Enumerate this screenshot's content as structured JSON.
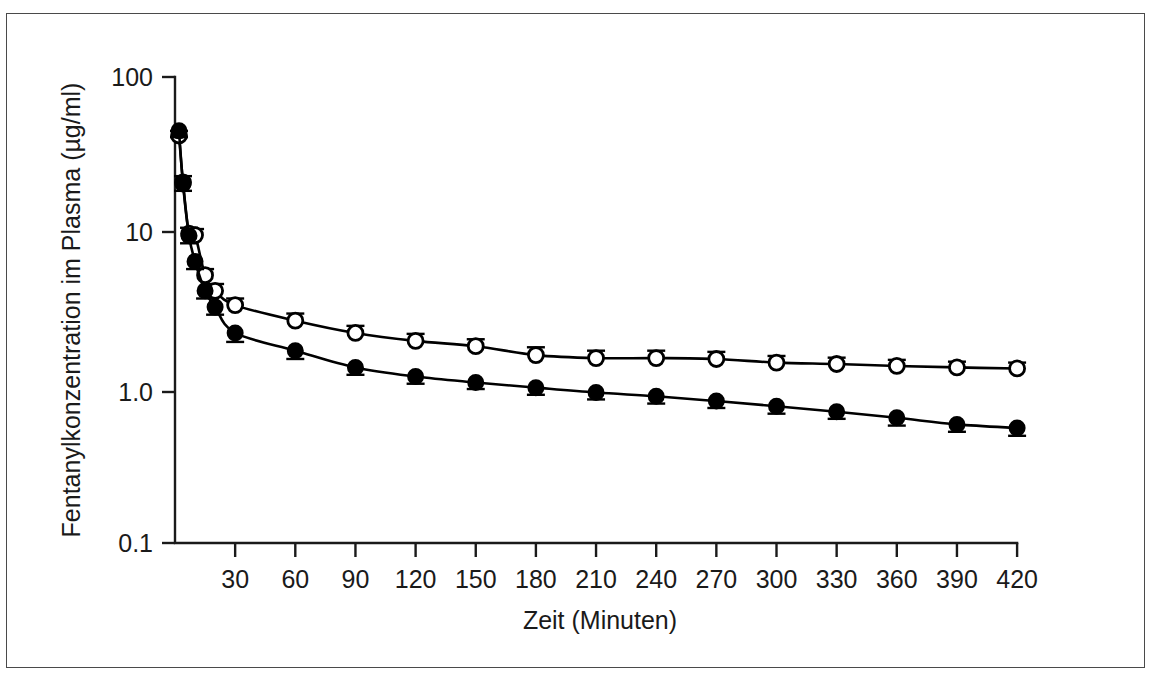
{
  "figure": {
    "has_outer_border": true,
    "background_color": "#ffffff",
    "foreground_color": "#1a1a1a"
  },
  "chart_data": {
    "type": "line",
    "title": "",
    "subtitle": "",
    "xlabel": "Zeit (Minuten)",
    "ylabel": "Fentanylkonzentration im µg/ml)",
    "ylabel_text": "Fentanylkonzentration im Plasma (µg/ml)",
    "yscale": "log",
    "xscale": "linear",
    "xlim": [
      0,
      420
    ],
    "ylim": [
      0.1,
      100
    ],
    "grid": false,
    "legend_position": "none",
    "x_tick_labels": [
      "30",
      "60",
      "90",
      "120",
      "150",
      "180",
      "210",
      "240",
      "270",
      "300",
      "330",
      "360",
      "390",
      "420"
    ],
    "x_ticks": [
      30,
      60,
      90,
      120,
      150,
      180,
      210,
      240,
      270,
      300,
      330,
      360,
      390,
      420
    ],
    "y_tick_labels": [
      "100",
      "10",
      "1.0",
      "0.1"
    ],
    "y_ticks": [
      100,
      10,
      1.0,
      0.1
    ],
    "series": [
      {
        "name": "offene Kreise",
        "marker": "open-circle",
        "color": "#000000",
        "x": [
          2,
          4,
          7,
          10,
          15,
          20,
          30,
          60,
          90,
          120,
          150,
          180,
          210,
          240,
          270,
          300,
          330,
          360,
          390,
          420
        ],
        "values": [
          42.0,
          21.0,
          9.8,
          9.6,
          5.3,
          4.2,
          3.4,
          2.7,
          2.25,
          2.0,
          1.85,
          1.62,
          1.55,
          1.55,
          1.53,
          1.45,
          1.42,
          1.38,
          1.35,
          1.33
        ],
        "errors": [
          3.0,
          2.0,
          0.9,
          0.9,
          0.5,
          0.45,
          0.35,
          0.3,
          0.25,
          0.22,
          0.2,
          0.2,
          0.18,
          0.18,
          0.17,
          0.15,
          0.14,
          0.13,
          0.12,
          0.12
        ]
      },
      {
        "name": "gefüllte Kreise",
        "marker": "filled-circle",
        "color": "#000000",
        "x": [
          2,
          4,
          7,
          10,
          15,
          20,
          30,
          60,
          90,
          120,
          150,
          180,
          210,
          240,
          270,
          300,
          330,
          360,
          390,
          420
        ],
        "values": [
          45.0,
          20.5,
          9.5,
          6.5,
          4.2,
          3.3,
          2.25,
          1.73,
          1.35,
          1.18,
          1.08,
          1.0,
          0.93,
          0.88,
          0.82,
          0.76,
          0.7,
          0.64,
          0.58,
          0.55
        ],
        "errors": [
          4.0,
          2.0,
          1.0,
          0.7,
          0.45,
          0.35,
          0.28,
          0.2,
          0.14,
          0.12,
          0.1,
          0.1,
          0.09,
          0.09,
          0.08,
          0.08,
          0.07,
          0.07,
          0.06,
          0.06
        ]
      }
    ]
  }
}
